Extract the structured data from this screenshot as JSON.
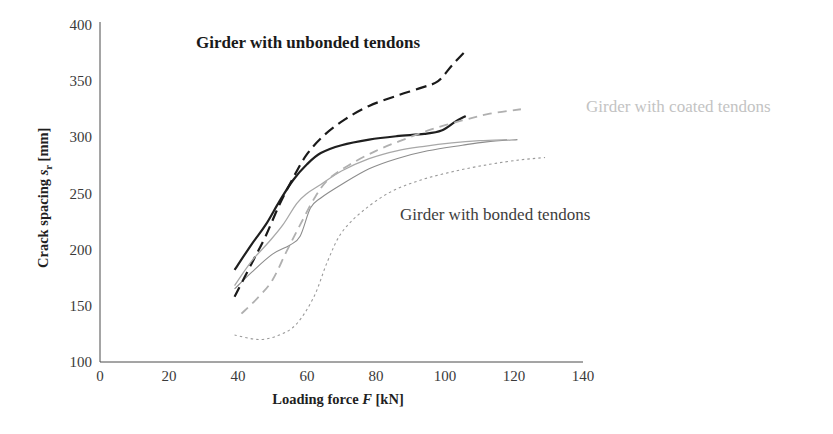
{
  "chart_data": {
    "type": "line",
    "title": "",
    "xlabel": "Loading force F [kN]",
    "ylabel": "Crack spacing sr [mm]",
    "xlim": [
      0,
      140
    ],
    "ylim": [
      100,
      400
    ],
    "xticks": [
      "0",
      "20",
      "40",
      "60",
      "80",
      "100",
      "120",
      "140"
    ],
    "yticks": [
      "100",
      "150",
      "200",
      "250",
      "300",
      "350",
      "400"
    ],
    "grid": false,
    "legend_position": "right",
    "series": [
      {
        "name": "N1(+)_EC2",
        "color": "#8c8c8c",
        "style": "solid",
        "width": 1.1,
        "points": [
          [
            39,
            165
          ],
          [
            44,
            180
          ],
          [
            50,
            196
          ],
          [
            55,
            204
          ],
          [
            58,
            212
          ],
          [
            61,
            237
          ],
          [
            64,
            246
          ],
          [
            70,
            258
          ],
          [
            78,
            272
          ],
          [
            86,
            281
          ],
          [
            95,
            288
          ],
          [
            105,
            293
          ],
          [
            112,
            296
          ],
          [
            121,
            298
          ]
        ]
      },
      {
        "name": "N1(+)_MC10",
        "color": "#9a9a9a",
        "style": "dotted",
        "width": 1.1,
        "points": [
          [
            39,
            124
          ],
          [
            46,
            120
          ],
          [
            52,
            124
          ],
          [
            57,
            134
          ],
          [
            62,
            158
          ],
          [
            66,
            190
          ],
          [
            70,
            215
          ],
          [
            76,
            234
          ],
          [
            84,
            251
          ],
          [
            93,
            262
          ],
          [
            103,
            270
          ],
          [
            113,
            276
          ],
          [
            122,
            280
          ],
          [
            129,
            282
          ]
        ]
      },
      {
        "name": "N6(+)_EC2",
        "color": "#1f1f1f",
        "style": "solid",
        "width": 2.2,
        "points": [
          [
            39,
            182
          ],
          [
            44,
            205
          ],
          [
            48,
            222
          ],
          [
            52,
            243
          ],
          [
            56,
            262
          ],
          [
            60,
            276
          ],
          [
            64,
            286
          ],
          [
            70,
            293
          ],
          [
            78,
            298
          ],
          [
            86,
            301
          ],
          [
            94,
            303
          ],
          [
            99,
            306
          ],
          [
            103,
            314
          ],
          [
            106,
            319
          ]
        ]
      },
      {
        "name": "N6(+)_MC10",
        "color": "#1a1a1a",
        "style": "dashed",
        "width": 2.2,
        "points": [
          [
            39,
            158
          ],
          [
            44,
            188
          ],
          [
            48,
            212
          ],
          [
            52,
            240
          ],
          [
            56,
            264
          ],
          [
            60,
            285
          ],
          [
            65,
            302
          ],
          [
            71,
            316
          ],
          [
            78,
            328
          ],
          [
            86,
            337
          ],
          [
            93,
            344
          ],
          [
            98,
            350
          ],
          [
            102,
            364
          ],
          [
            106,
            377
          ]
        ]
      },
      {
        "name": "N4(+)_EC2",
        "color": "#a8a8a8",
        "style": "solid",
        "width": 1.3,
        "points": [
          [
            39,
            168
          ],
          [
            44,
            190
          ],
          [
            49,
            207
          ],
          [
            53,
            222
          ],
          [
            57,
            241
          ],
          [
            60,
            250
          ],
          [
            64,
            258
          ],
          [
            70,
            270
          ],
          [
            78,
            281
          ],
          [
            86,
            288
          ],
          [
            94,
            292
          ],
          [
            102,
            295
          ],
          [
            110,
            297
          ],
          [
            118,
            298
          ]
        ]
      },
      {
        "name": "N4(+)_MC10",
        "color": "#b0b0b0",
        "style": "dashed",
        "width": 1.8,
        "points": [
          [
            41,
            143
          ],
          [
            46,
            158
          ],
          [
            50,
            173
          ],
          [
            54,
            198
          ],
          [
            58,
            222
          ],
          [
            62,
            245
          ],
          [
            66,
            262
          ],
          [
            72,
            275
          ],
          [
            80,
            288
          ],
          [
            88,
            298
          ],
          [
            96,
            307
          ],
          [
            105,
            315
          ],
          [
            113,
            321
          ],
          [
            122,
            325
          ]
        ]
      }
    ],
    "annotations": [
      {
        "text": "Girder with unbonded tendons",
        "x_px": 196,
        "y_px": 48,
        "style": "bold",
        "color": "#1a1a1a"
      },
      {
        "text": "Girder with coated tendons",
        "x_px": 586,
        "y_px": 112,
        "style": "faint",
        "color": "#c3c3c3"
      },
      {
        "text": "Girder with bonded tendons",
        "x_px": 400,
        "y_px": 220,
        "style": "plain",
        "color": "#3d3d3d"
      }
    ]
  },
  "axes": {
    "y_title_main": "Crack spacing ",
    "y_title_symbol": "s",
    "y_title_subscript": "r",
    "y_title_unit": " [mm]",
    "x_title_main": "Loading force ",
    "x_title_symbol": "F",
    "x_title_unit": " [kN]"
  },
  "legend": {
    "entries": [
      {
        "label": "N1(+)_EC2"
      },
      {
        "label": "N1(+)_MC10"
      },
      {
        "label": "N6(+)_EC2"
      },
      {
        "label": "N6(+)_MC10"
      },
      {
        "label": "N4(+)_EC2"
      },
      {
        "label": "N4(+)_MC10"
      }
    ]
  }
}
